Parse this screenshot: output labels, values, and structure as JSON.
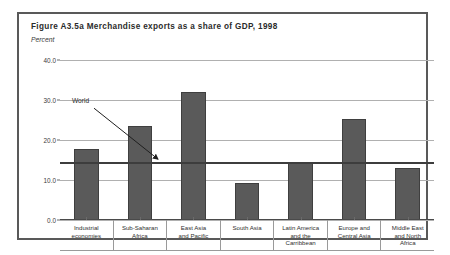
{
  "figure": {
    "title": "Figure A3.5a  Merchandise exports as a share of GDP, 1998",
    "unit_label": "Percent"
  },
  "chart_data": {
    "type": "bar",
    "title": "Figure A3.5a  Merchandise exports as a share of GDP, 1998",
    "subtitle": "Percent",
    "xlabel": "",
    "ylabel": "Percent",
    "ylim": [
      0.0,
      40.0
    ],
    "yticks": [
      0.0,
      10.0,
      20.0,
      30.0,
      40.0
    ],
    "ytick_labels": [
      "0.0",
      "10.0",
      "20.0",
      "30.0",
      "40.0"
    ],
    "grid": true,
    "legend": "none",
    "bar_color": "#5a5a5a",
    "categories": [
      "Industrial economies",
      "Sub-Saharan Africa",
      "East Asia and Pacific",
      "South Asia",
      "Latin America and the Carribbean",
      "Europe and Central Asia",
      "Middle East and North Africa"
    ],
    "category_label_lines": [
      [
        "Industrial",
        "economies"
      ],
      [
        "Sub-Saharan",
        "Africa"
      ],
      [
        "East Asia",
        "and Pacific"
      ],
      [
        "South Asia"
      ],
      [
        "Latin America",
        "and the",
        "Carribbean"
      ],
      [
        "Europe and",
        "Central Asia"
      ],
      [
        "Middle East",
        "and North",
        "Africa"
      ]
    ],
    "values": [
      17.8,
      23.5,
      32.0,
      9.2,
      14.5,
      25.2,
      13.0
    ],
    "annotations": [
      {
        "label": "World",
        "type": "reference-line",
        "value": 14.2,
        "line_color": "#3d3d3d"
      }
    ]
  }
}
